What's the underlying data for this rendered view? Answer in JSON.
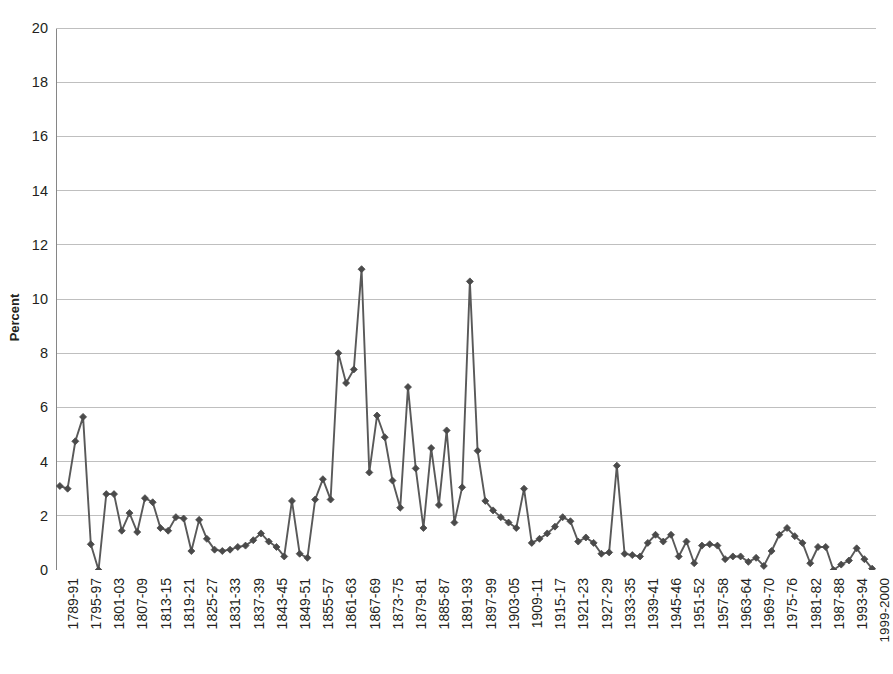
{
  "chart_data": {
    "type": "line",
    "title": "",
    "subtitle": "",
    "xlabel": "",
    "ylabel": "Percent",
    "ylim": [
      0,
      20
    ],
    "ytick_step": 2,
    "yticks": [
      0,
      2,
      4,
      6,
      8,
      10,
      12,
      14,
      16,
      18,
      20
    ],
    "grid": true,
    "grid_axis": "y",
    "legend": false,
    "legend_position": "none",
    "marker": "diamond",
    "line_color": "#595959",
    "marker_color": "#4a4a4a",
    "grid_color": "#bfbfbf",
    "axis_color": "#868686",
    "text_color": "#231f20",
    "background": "#ffffff",
    "x_tick_label_interval": 3,
    "categories": [
      "1789-91",
      "1791-93",
      "1793-95",
      "1795-97",
      "1797-99",
      "1799-1801",
      "1801-03",
      "1803-05",
      "1805-07",
      "1807-09",
      "1809-11",
      "1811-13",
      "1813-15",
      "1815-17",
      "1817-19",
      "1819-21",
      "1821-23",
      "1823-25",
      "1825-27",
      "1827-29",
      "1829-31",
      "1831-33",
      "1833-35",
      "1835-37",
      "1837-39",
      "1839-41",
      "1841-43",
      "1843-45",
      "1845-47",
      "1847-49",
      "1849-51",
      "1851-53",
      "1853-55",
      "1855-57",
      "1857-59",
      "1859-61",
      "1861-63",
      "1863-65",
      "1865-67",
      "1867-69",
      "1869-71",
      "1871-73",
      "1873-75",
      "1875-77",
      "1877-79",
      "1879-81",
      "1881-83",
      "1883-85",
      "1885-87",
      "1887-89",
      "1889-91",
      "1891-93",
      "1893-95",
      "1895-97",
      "1897-99",
      "1899-01",
      "1901-03",
      "1903-05",
      "1905-07",
      "1907-09",
      "1909-11",
      "1911-13",
      "1913-15",
      "1915-17",
      "1917-19",
      "1919-21",
      "1921-23",
      "1923-25",
      "1925-27",
      "1927-29",
      "1929-31",
      "1931-33",
      "1933-35",
      "1935-37",
      "1937-39",
      "1939-41",
      "1941-42",
      "1943-44",
      "1945-46",
      "1947-48",
      "1949-50",
      "1951-52",
      "1953-54",
      "1955-56",
      "1957-58",
      "1959-60",
      "1961-62",
      "1963-64",
      "1965-66",
      "1967-68",
      "1969-70",
      "1971-72",
      "1973-74",
      "1975-76",
      "1977-78",
      "1979-80",
      "1981-82",
      "1983-84",
      "1985-86",
      "1987-88",
      "1989-90",
      "1991-92",
      "1993-94",
      "1995-96",
      "1997-98",
      "1999-2000"
    ],
    "x_tick_labels_shown": [
      "1789-91",
      "1795-97",
      "1801-03",
      "1807-09",
      "1813-15",
      "1819-21",
      "1825-27",
      "1831-33",
      "1837-39",
      "1843-45",
      "1849-51",
      "1855-57",
      "1861-63",
      "1867-69",
      "1873-75",
      "1879-81",
      "1885-87",
      "1891-93",
      "1897-99",
      "1903-05",
      "1909-11",
      "1915-17",
      "1921-23",
      "1927-29",
      "1933-35",
      "1939-41",
      "1945-46",
      "1951-52",
      "1957-58",
      "1963-64",
      "1969-70",
      "1975-76",
      "1981-82",
      "1987-88",
      "1993-94",
      "1999-2000"
    ],
    "values": [
      3.1,
      3.0,
      4.75,
      5.65,
      0.95,
      0.0,
      2.8,
      2.8,
      1.45,
      2.1,
      1.4,
      2.65,
      2.5,
      1.55,
      1.45,
      1.95,
      1.9,
      0.7,
      1.85,
      1.15,
      0.75,
      0.7,
      0.75,
      0.85,
      0.9,
      1.1,
      1.35,
      1.05,
      0.85,
      0.5,
      2.55,
      0.6,
      0.45,
      2.6,
      3.35,
      2.6,
      8.0,
      6.9,
      7.4,
      11.1,
      3.6,
      5.7,
      4.9,
      3.3,
      2.3,
      6.75,
      3.75,
      1.55,
      4.5,
      2.4,
      5.15,
      1.75,
      3.05,
      10.65,
      4.4,
      2.55,
      2.2,
      1.95,
      1.75,
      1.55,
      3.0,
      1.0,
      1.15,
      1.35,
      1.6,
      1.95,
      1.8,
      1.05,
      1.2,
      1.0,
      0.6,
      0.65,
      3.85,
      0.6,
      0.55,
      0.5,
      1.0,
      1.3,
      1.05,
      1.3,
      0.5,
      1.05,
      0.25,
      0.9,
      0.95,
      0.9,
      0.4,
      0.5,
      0.5,
      0.3,
      0.45,
      0.15,
      0.7,
      1.3,
      1.55,
      1.25,
      1.0,
      0.25,
      0.85,
      0.85,
      0.0,
      0.2,
      0.35,
      0.8,
      0.4,
      0.05
    ]
  }
}
